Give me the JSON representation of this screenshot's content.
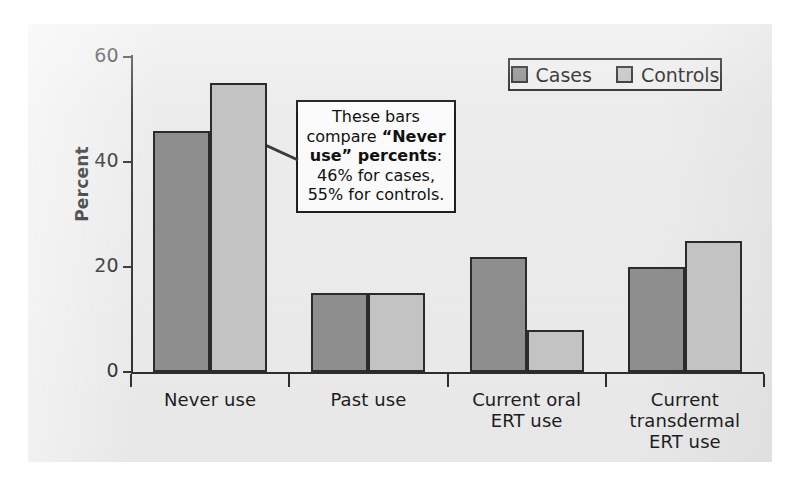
{
  "chart_data": {
    "type": "bar",
    "title": "",
    "xlabel": "",
    "ylabel": "Percent",
    "ylim": [
      0,
      60
    ],
    "yticks": [
      0,
      20,
      40,
      60
    ],
    "grid": false,
    "legend_position": "top-right",
    "categories": [
      "Never use",
      "Past use",
      "Current oral ERT use",
      "Current transdermal ERT use"
    ],
    "category_lines": [
      [
        "Never use"
      ],
      [
        "Past use"
      ],
      [
        "Current oral",
        "ERT use"
      ],
      [
        "Current",
        "transdermal",
        "ERT use"
      ]
    ],
    "series": [
      {
        "name": "Cases",
        "color": "#8e8e8e",
        "values": [
          46,
          15,
          22,
          20
        ]
      },
      {
        "name": "Controls",
        "color": "#c3c3c3",
        "values": [
          55,
          15,
          8,
          25
        ]
      }
    ],
    "annotations": [
      {
        "id": "never-use-callout",
        "text_lines": [
          {
            "segments": [
              {
                "text": "These bars",
                "bold": false
              }
            ]
          },
          {
            "segments": [
              {
                "text": "compare ",
                "bold": false
              },
              {
                "text": "“Never",
                "bold": true
              }
            ]
          },
          {
            "segments": [
              {
                "text": "use” percents",
                "bold": true
              },
              {
                "text": ":",
                "bold": false
              }
            ]
          },
          {
            "segments": [
              {
                "text": "46% for cases,",
                "bold": false
              }
            ]
          },
          {
            "segments": [
              {
                "text": "55% for controls.",
                "bold": false
              }
            ]
          }
        ],
        "points_to": "Never use bars"
      }
    ]
  },
  "axis": {
    "y_tick_labels": [
      "60",
      "40",
      "20",
      "0"
    ],
    "y_title": "Percent"
  },
  "legend": {
    "entries": [
      {
        "label": "Cases",
        "swatch": "cases-swatch"
      },
      {
        "label": "Controls",
        "swatch": "controls-swatch"
      }
    ]
  },
  "colors": {
    "cases": "#8e8e8e",
    "controls": "#c3c3c3",
    "axis": "#2e2e2e",
    "panel_background": "#ececed",
    "page_background": "#ffffff"
  }
}
